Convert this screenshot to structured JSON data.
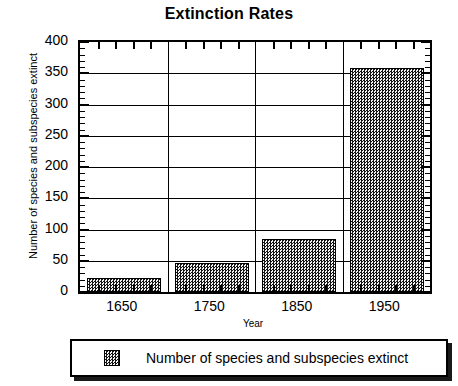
{
  "chart_data": {
    "type": "bar",
    "title": "Extinction Rates",
    "xlabel": "Year",
    "ylabel": "Number of species and subspecies extinct",
    "categories": [
      "1650",
      "1750",
      "1850",
      "1950"
    ],
    "values": [
      22,
      47,
      85,
      358
    ],
    "series": [
      {
        "name": "Number of species and subspecies extinct",
        "values": [
          22,
          47,
          85,
          358
        ]
      }
    ],
    "ylim": [
      0,
      400
    ],
    "ytick_labels": [
      "400",
      "350",
      "300",
      "250",
      "200",
      "150",
      "100",
      "50",
      "0"
    ],
    "ytick_values": [
      400,
      350,
      300,
      250,
      200,
      150,
      100,
      50,
      0
    ],
    "y_major_step": 50,
    "y_minor_step": 10,
    "grid": "horizontal-and-category-separators",
    "legend_position": "bottom",
    "legend_entries": [
      "Number of species and subspecies extinct"
    ],
    "bar_fill": "checkerboard-dither-gray",
    "colors": {
      "axis": "#000000",
      "bar_fill_dark": "#141414",
      "bar_fill_light": "#f2f2f2",
      "background": "#ffffff"
    }
  },
  "legend": {
    "label": "Number of species and subspecies extinct"
  }
}
